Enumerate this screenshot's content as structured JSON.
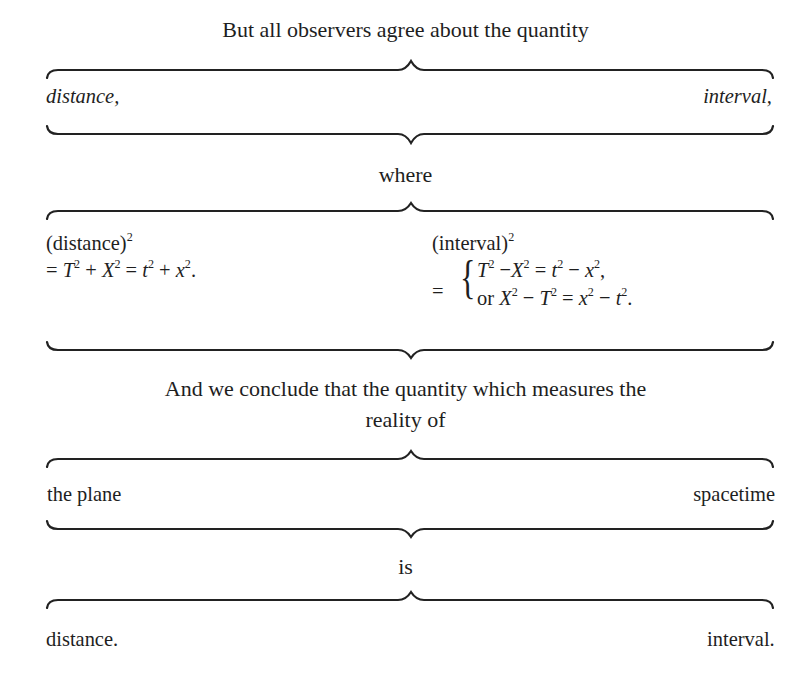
{
  "header": {
    "line1": "But all observers agree about the quantity"
  },
  "pair1": {
    "left": "distance,",
    "right": "interval,"
  },
  "connector1": "where",
  "pair2": {
    "left": {
      "label": "(distance)",
      "label_exp": "2",
      "equation_parts": {
        "eq": "=",
        "T": "T",
        "X": "X",
        "t": "t",
        "x": "x",
        "exp": "2",
        "plus": "+",
        "end": "."
      }
    },
    "right": {
      "label": "(interval)",
      "label_exp": "2",
      "eq": "=",
      "case1": {
        "a": "T",
        "b": "X",
        "c": "t",
        "d": "x",
        "minus": "−",
        "equals": "=",
        "end": ","
      },
      "case2": {
        "or": "or",
        "a": "X",
        "b": "T",
        "c": "x",
        "d": "t",
        "minus": "−",
        "equals": "=",
        "end": "."
      }
    }
  },
  "conclusion": {
    "line1": "And we conclude that the quantity which measures the",
    "line2": "reality of"
  },
  "pair3": {
    "left": "the plane",
    "right": "spacetime"
  },
  "connector2": "is",
  "pair4": {
    "left": "distance.",
    "right": "interval."
  }
}
